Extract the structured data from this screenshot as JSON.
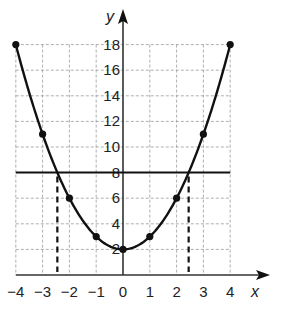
{
  "chart_data": {
    "type": "line",
    "title": "",
    "xlabel": "x",
    "ylabel": "y",
    "xlim": [
      -4,
      4
    ],
    "ylim": [
      0,
      18
    ],
    "grid": true,
    "x_ticks": [
      -4,
      -3,
      -2,
      -1,
      0,
      1,
      2,
      3,
      4
    ],
    "x_tick_labels": [
      "−4",
      "−3",
      "−2",
      "−1",
      "0",
      "1",
      "2",
      "3",
      "4"
    ],
    "y_ticks": [
      2,
      4,
      6,
      8,
      10,
      12,
      14,
      16,
      18
    ],
    "y_tick_labels": [
      "2",
      "4",
      "6",
      "8",
      "10",
      "12",
      "14",
      "16",
      "18"
    ],
    "series": [
      {
        "name": "y = x^2 + 2",
        "kind": "curve",
        "x": [
          -4,
          -3,
          -2,
          -1,
          0,
          1,
          2,
          3,
          4
        ],
        "values": [
          18,
          11,
          6,
          3,
          2,
          3,
          6,
          11,
          18
        ],
        "markers": true
      },
      {
        "name": "y = 8",
        "kind": "horizontal-line",
        "y": 8,
        "x_range": [
          -4,
          4
        ]
      }
    ],
    "annotations": [
      {
        "kind": "dashed-vertical",
        "x": -2.45,
        "from_y": 0,
        "to_y": 8
      },
      {
        "kind": "dashed-vertical",
        "x": 2.45,
        "from_y": 0,
        "to_y": 8
      }
    ]
  },
  "style": {
    "line_color": "#111111",
    "grid_color": "#9a9a9a",
    "axis_color": "#333333"
  }
}
